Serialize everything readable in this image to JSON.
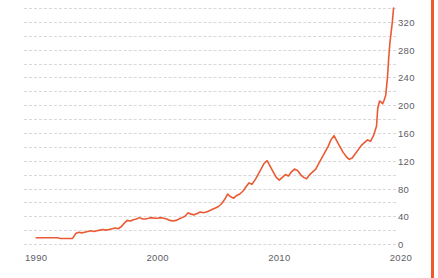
{
  "chart_data": {
    "type": "line",
    "title": "",
    "subtitle": "",
    "xlabel": "",
    "ylabel": "",
    "xlim": [
      1989.0,
      2019.6
    ],
    "ylim": [
      0,
      340
    ],
    "grid": true,
    "grid_style": "dashed-horizontal",
    "legend": "none",
    "y_ticks": [
      0,
      40,
      80,
      120,
      160,
      200,
      240,
      280,
      320
    ],
    "y_tick_labels": [
      "0",
      "40",
      "80",
      "120",
      "160",
      "200",
      "240",
      "280",
      "320"
    ],
    "x_ticks": [
      1990,
      2000,
      2010,
      2020
    ],
    "x_tick_labels": [
      "1990",
      "2000",
      "2010",
      "2020"
    ],
    "line_color": "#ea5b33",
    "accent_color": "#f05a28",
    "grid_color": "#d8d8d8",
    "axis_label_color": "#5e5e66",
    "background": "#ffffff",
    "series": [
      {
        "name": "value",
        "x": [
          1990.0,
          1990.25,
          1990.5,
          1990.75,
          1991.0,
          1991.25,
          1991.5,
          1991.75,
          1992.0,
          1992.25,
          1992.5,
          1992.75,
          1993.0,
          1993.25,
          1993.5,
          1993.75,
          1994.0,
          1994.25,
          1994.5,
          1994.75,
          1995.0,
          1995.25,
          1995.5,
          1995.75,
          1996.0,
          1996.25,
          1996.5,
          1996.75,
          1997.0,
          1997.25,
          1997.5,
          1997.75,
          1998.0,
          1998.25,
          1998.5,
          1998.75,
          1999.0,
          1999.25,
          1999.5,
          1999.75,
          2000.0,
          2000.25,
          2000.5,
          2000.75,
          2001.0,
          2001.25,
          2001.5,
          2001.75,
          2002.0,
          2002.25,
          2002.5,
          2002.75,
          2003.0,
          2003.25,
          2003.5,
          2003.75,
          2004.0,
          2004.25,
          2004.5,
          2004.75,
          2005.0,
          2005.25,
          2005.5,
          2005.75,
          2006.0,
          2006.25,
          2006.5,
          2006.75,
          2007.0,
          2007.25,
          2007.5,
          2007.75,
          2008.0,
          2008.25,
          2008.5,
          2008.75,
          2009.0,
          2009.25,
          2009.5,
          2009.75,
          2010.0,
          2010.25,
          2010.5,
          2010.75,
          2011.0,
          2011.25,
          2011.5,
          2011.75,
          2012.0,
          2012.25,
          2012.5,
          2012.75,
          2013.0,
          2013.25,
          2013.5,
          2013.75,
          2014.0,
          2014.25,
          2014.5,
          2014.75,
          2015.0,
          2015.25,
          2015.5,
          2015.75,
          2016.0,
          2016.25,
          2016.5,
          2016.75,
          2017.0,
          2017.25,
          2017.5,
          2017.75,
          2018.0,
          2018.1,
          2018.25,
          2018.4,
          2018.5,
          2018.6,
          2018.75,
          2018.9,
          2019.0,
          2019.1,
          2019.2,
          2019.3,
          2019.4
        ],
        "values": [
          9,
          9,
          9,
          9,
          9,
          9,
          9,
          9,
          8,
          8,
          8,
          8,
          8,
          15,
          17,
          16,
          17,
          18,
          19,
          18,
          19,
          20,
          21,
          20,
          21,
          22,
          23,
          22,
          25,
          30,
          34,
          33,
          35,
          36,
          38,
          36,
          36,
          37,
          38,
          37,
          37,
          38,
          37,
          36,
          34,
          33,
          34,
          36,
          38,
          40,
          45,
          43,
          42,
          44,
          46,
          45,
          46,
          48,
          50,
          52,
          54,
          58,
          64,
          72,
          68,
          66,
          70,
          72,
          76,
          82,
          88,
          86,
          92,
          100,
          108,
          116,
          120,
          112,
          104,
          96,
          92,
          96,
          100,
          98,
          104,
          108,
          106,
          100,
          96,
          94,
          100,
          104,
          108,
          116,
          124,
          132,
          140,
          150,
          156,
          148,
          140,
          132,
          126,
          122,
          124,
          130,
          136,
          142,
          146,
          150,
          148,
          156,
          170,
          196,
          206,
          204,
          202,
          206,
          214,
          240,
          268,
          290,
          305,
          320,
          340
        ]
      }
    ],
    "annotations": []
  },
  "accent": {
    "right_bar_color": "#f05a28"
  }
}
